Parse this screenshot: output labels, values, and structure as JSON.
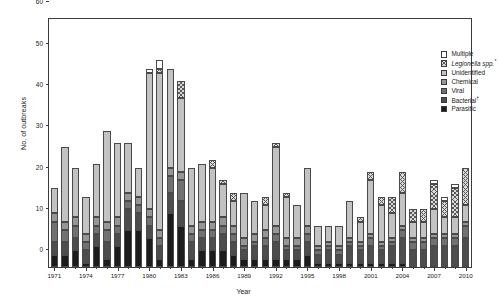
{
  "chart_data": {
    "type": "bar",
    "subtype": "stacked",
    "title": "",
    "xlabel": "Year",
    "ylabel": "No. of outbreaks",
    "ylim": [
      0,
      60
    ],
    "yticks": [
      0,
      10,
      20,
      30,
      40,
      50,
      60
    ],
    "xlim": [
      1971,
      2010
    ],
    "xticks_labeled": [
      1971,
      1974,
      1977,
      1980,
      1983,
      1986,
      1989,
      1992,
      1995,
      1998,
      2001,
      2004,
      2007,
      2010
    ],
    "grid": false,
    "legend_position": "top-right",
    "categories": [
      1971,
      1972,
      1973,
      1974,
      1975,
      1976,
      1977,
      1978,
      1979,
      1980,
      1981,
      1982,
      1983,
      1984,
      1985,
      1986,
      1987,
      1988,
      1989,
      1990,
      1991,
      1992,
      1993,
      1994,
      1995,
      1996,
      1997,
      1998,
      1999,
      2000,
      2001,
      2002,
      2003,
      2004,
      2005,
      2006,
      2007,
      2008,
      2009,
      2010
    ],
    "series": [
      {
        "name": "Parasitic",
        "color": "#1c1c1c",
        "values": [
          3,
          3,
          4,
          1,
          5,
          2,
          5,
          9,
          9,
          7,
          2,
          13,
          10,
          2,
          4,
          4,
          4,
          3,
          2,
          2,
          2,
          2,
          2,
          2,
          3,
          1,
          1,
          1,
          1,
          1,
          1,
          1,
          1,
          1,
          0,
          0,
          0,
          0,
          0,
          0
        ]
      },
      {
        "name": "Bacterial",
        "color": "#4d4d4d",
        "values": [
          3,
          3,
          3,
          3,
          3,
          4,
          3,
          5,
          4,
          3,
          3,
          5,
          6,
          4,
          3,
          3,
          4,
          3,
          2,
          3,
          3,
          4,
          2,
          2,
          3,
          2,
          3,
          2,
          4,
          3,
          4,
          3,
          4,
          6,
          4,
          4,
          5,
          5,
          5,
          7
        ]
      },
      {
        "name": "Viral",
        "color": "#717171",
        "values": [
          5,
          3,
          3,
          2,
          2,
          3,
          2,
          2,
          2,
          2,
          2,
          4,
          5,
          2,
          2,
          2,
          2,
          2,
          1,
          1,
          2,
          2,
          1,
          1,
          2,
          1,
          1,
          1,
          1,
          1,
          2,
          1,
          1,
          2,
          2,
          2,
          2,
          2,
          2,
          3
        ]
      },
      {
        "name": "Chemical",
        "color": "#969696",
        "values": [
          2,
          2,
          2,
          2,
          2,
          2,
          2,
          2,
          2,
          2,
          2,
          2,
          2,
          2,
          2,
          2,
          2,
          2,
          2,
          2,
          2,
          2,
          2,
          2,
          2,
          1,
          1,
          1,
          1,
          1,
          1,
          1,
          1,
          1,
          1,
          1,
          1,
          1,
          1,
          1
        ]
      },
      {
        "name": "Unidentified",
        "color": "#c2c2c2",
        "values": [
          6,
          18,
          12,
          9,
          13,
          22,
          18,
          12,
          7,
          33,
          38,
          24,
          18,
          14,
          14,
          13,
          8,
          6,
          11,
          8,
          6,
          19,
          10,
          8,
          14,
          5,
          4,
          5,
          9,
          5,
          13,
          9,
          6,
          8,
          4,
          4,
          6,
          4,
          4,
          4
        ]
      },
      {
        "name": "Legionella spp.",
        "color": "#d9d9d9",
        "pattern": "cross-hatch",
        "values": [
          0,
          0,
          0,
          0,
          0,
          0,
          0,
          0,
          0,
          0,
          1,
          0,
          4,
          0,
          0,
          2,
          1,
          2,
          0,
          0,
          2,
          1,
          1,
          0,
          0,
          0,
          0,
          0,
          0,
          1,
          2,
          2,
          4,
          5,
          3,
          3,
          6,
          4,
          7,
          9
        ]
      },
      {
        "name": "Multiple",
        "color": "#ffffff",
        "values": [
          0,
          0,
          0,
          0,
          0,
          0,
          0,
          0,
          0,
          1,
          2,
          0,
          0,
          0,
          0,
          0,
          0,
          0,
          0,
          0,
          0,
          0,
          0,
          0,
          0,
          0,
          0,
          0,
          0,
          0,
          0,
          0,
          0,
          0,
          0,
          0,
          1,
          1,
          1,
          0
        ]
      }
    ],
    "totals": [
      19,
      29,
      24,
      17,
      25,
      33,
      30,
      30,
      24,
      48,
      50,
      48,
      45,
      24,
      25,
      26,
      21,
      18,
      18,
      15,
      17,
      30,
      18,
      15,
      24,
      10,
      10,
      10,
      16,
      12,
      23,
      17,
      17,
      23,
      14,
      14,
      21,
      17,
      20,
      24
    ]
  },
  "legend": {
    "items": [
      {
        "label": "Multiple",
        "fill": "f-multiple",
        "italic": false,
        "footnote": ""
      },
      {
        "label": "Legionella spp.",
        "fill": "f-legionella",
        "italic": true,
        "footnote": "*"
      },
      {
        "label": "Unidentified",
        "fill": "f-unident",
        "italic": false,
        "footnote": ""
      },
      {
        "label": "Chemical",
        "fill": "f-chemical",
        "italic": false,
        "footnote": ""
      },
      {
        "label": "Viral",
        "fill": "f-viral",
        "italic": false,
        "footnote": ""
      },
      {
        "label": "Bacterial",
        "fill": "f-bacterial",
        "italic": false,
        "footnote": "†"
      },
      {
        "label": "Parasitic",
        "fill": "f-parasitic",
        "italic": false,
        "footnote": ""
      }
    ]
  },
  "axes": {
    "ylabel": "No. of outbreaks",
    "xlabel": "Year"
  }
}
